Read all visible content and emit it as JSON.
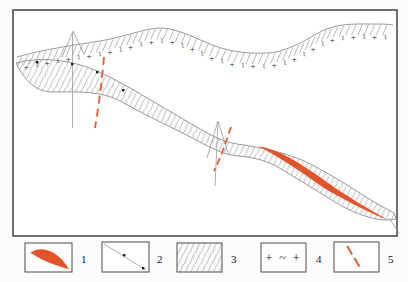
{
  "figure": {
    "kind": "geological-sketch-map",
    "map": {
      "band_symbols": [
        "+",
        "~"
      ],
      "colors": {
        "ore": "#e2532a",
        "fault": "#df5f2f",
        "line": "#8f8f8f",
        "frame": "#414141",
        "dot": "#1b1b1b",
        "background": "#ffffff"
      }
    },
    "legend": {
      "items": [
        {
          "label": "1",
          "symbol": "ore-body-lens"
        },
        {
          "label": "2",
          "symbol": "boundary-line-with-points"
        },
        {
          "label": "3",
          "symbol": "hatched-rock-unit"
        },
        {
          "label": "4",
          "symbol": "plus-tilde-rock-unit",
          "symbol_text": "+ ~ +"
        },
        {
          "label": "5",
          "symbol": "fault-dashed-line"
        }
      ]
    }
  }
}
